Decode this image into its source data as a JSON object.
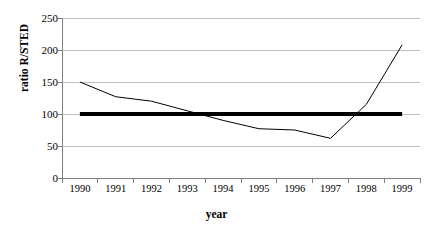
{
  "chart_data": {
    "type": "line",
    "title": "",
    "xlabel": "year",
    "ylabel": "ratio R/STED",
    "categories": [
      "1990",
      "1991",
      "1992",
      "1993",
      "1994",
      "1995",
      "1996",
      "1997",
      "1998",
      "1999"
    ],
    "series": [
      {
        "name": "ratio R/STED",
        "values": [
          150,
          127,
          120,
          105,
          90,
          77,
          75,
          62,
          115,
          208
        ],
        "color": "#000000",
        "line_width": 1
      },
      {
        "name": "reference",
        "values": [
          100,
          100,
          100,
          100,
          100,
          100,
          100,
          100,
          100,
          100
        ],
        "color": "#000000",
        "line_width": 4
      }
    ],
    "ylim": [
      0,
      250
    ],
    "yticks": [
      0,
      50,
      100,
      150,
      200,
      250
    ],
    "ytick_labels": [
      "0",
      "50",
      "100",
      "150",
      "200",
      "250"
    ],
    "grid": true,
    "grid_color": "#bfbfbf",
    "legend": "none",
    "axis_color": "#808080",
    "background": "#ffffff"
  },
  "axes": {
    "y_title": "ratio R/STED",
    "x_title": "year"
  }
}
